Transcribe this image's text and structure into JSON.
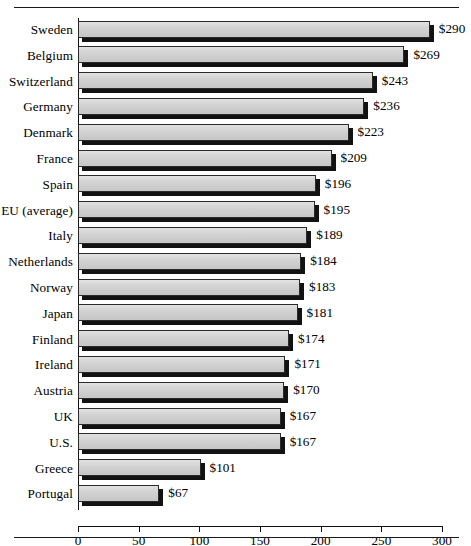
{
  "chart_data": {
    "type": "bar",
    "orientation": "horizontal",
    "title": "",
    "xlabel": "",
    "ylabel": "",
    "xlim": [
      0,
      300
    ],
    "grid": false,
    "legend": null,
    "value_prefix": "$",
    "categories": [
      "Sweden",
      "Belgium",
      "Switzerland",
      "Germany",
      "Denmark",
      "France",
      "Spain",
      "EU (average)",
      "Italy",
      "Netherlands",
      "Norway",
      "Japan",
      "Finland",
      "Ireland",
      "Austria",
      "UK",
      "U.S.",
      "Greece",
      "Portugal"
    ],
    "values": [
      290,
      269,
      243,
      236,
      223,
      209,
      196,
      195,
      189,
      184,
      183,
      181,
      174,
      171,
      170,
      167,
      167,
      101,
      67
    ],
    "value_labels": [
      "$290",
      "$269",
      "$243",
      "$236",
      "$223",
      "$209",
      "$196",
      "$195",
      "$189",
      "$184",
      "$183",
      "$181",
      "$174",
      "$171",
      "$170",
      "$167",
      "$167",
      "$101",
      "$67"
    ],
    "xticks": [
      0,
      50,
      100,
      150,
      200,
      250,
      300
    ],
    "xtick_labels": [
      "0",
      "50",
      "100",
      "150",
      "200",
      "250",
      "300"
    ],
    "colors": {
      "bar_face": "#d2d2d2",
      "bar_shadow": "#121212",
      "axis": "#111111",
      "text": "#000000",
      "background": "#ffffff"
    }
  }
}
